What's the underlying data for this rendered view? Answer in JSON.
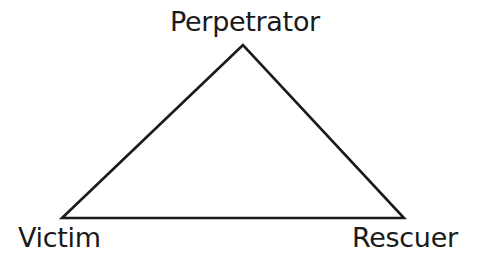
{
  "diagram": {
    "type": "triangle",
    "stroke_color": "#1a1a1a",
    "background_color": "#ffffff",
    "vertices": {
      "top": {
        "label": "Perpetrator",
        "x": 243,
        "y": 45
      },
      "left": {
        "label": "Victim",
        "x": 62,
        "y": 218
      },
      "right": {
        "label": "Rescuer",
        "x": 404,
        "y": 218
      }
    }
  }
}
